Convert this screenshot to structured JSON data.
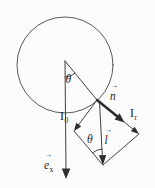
{
  "figure": {
    "colors": {
      "stroke": "#2e2e2e",
      "background": "#fcfcfc"
    },
    "labels": {
      "theta_top": {
        "base": "θ"
      },
      "n_vector": {
        "base": "n",
        "accent": "→"
      },
      "I_r": {
        "base": "I",
        "sub": "r"
      },
      "I_0": {
        "base": "I",
        "sub": "0"
      },
      "theta_bottom": {
        "base": "θ"
      },
      "l_vector": {
        "base": "l",
        "accent": "→"
      },
      "e_x_vector": {
        "base": "e",
        "accent": "→",
        "sub": "x"
      }
    }
  }
}
